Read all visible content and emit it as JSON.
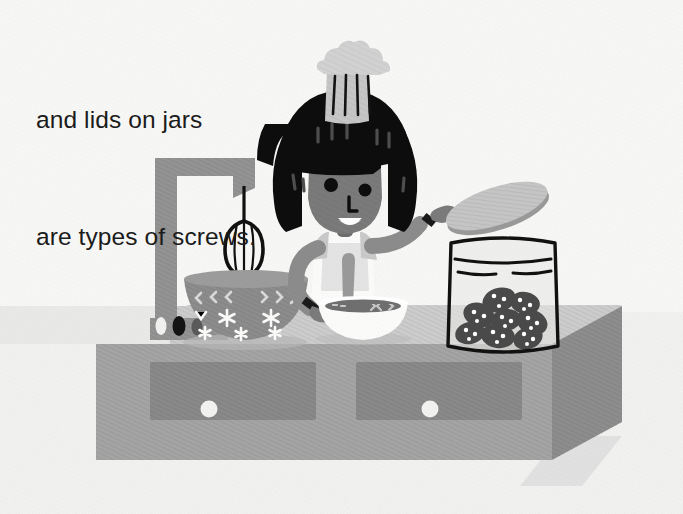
{
  "page": {
    "width": 683,
    "height": 514,
    "background_color": "#f7f7f5",
    "kind": "childrens-book-illustration-page"
  },
  "caption": {
    "line1": "and lids on jars",
    "line2": "are types of screws.",
    "full_text": "and lids on jars are types of screws.",
    "color": "#1b1b1b",
    "font_size_px": 24.5,
    "align": "left"
  },
  "palette": {
    "paper": "#f7f7f5",
    "paper_shade": "#efefec",
    "counter_top": "#cfcfcf",
    "counter_front": "#a5a5a5",
    "counter_side": "#8e8e8e",
    "drawer_panel": "#8a8a8a",
    "knob_white": "#f2f2f0",
    "shadow": "#d8d8d6",
    "skin": "#7b7b7b",
    "hair_black": "#0d0d0d",
    "hair_highlight": "#4a4a4a",
    "hat_light": "#d2d2d2",
    "hat_mid": "#bdbdbd",
    "apron_white": "#fbfbfa",
    "shirt_gray": "#c9c9c9",
    "sleeve_gray": "#8c8c8c",
    "cuff_dark": "#1a1a1a",
    "mixer_gray": "#949494",
    "mixer_bowl": "#8d8d8d",
    "mixer_bowl_rim": "#9c9c9c",
    "bowl_white": "#fbfbfa",
    "bowl_content": "#6f6f6f",
    "jar_outline": "#111111",
    "jar_glass": "#e8e8e6",
    "cookie_dark": "#4a4a4a",
    "cookie_chip": "#ffffff",
    "lid_face": "#c6c6c6",
    "lid_edge": "#9a9a9a"
  },
  "scene": {
    "title": "Chef baking at a kitchen counter",
    "elements": [
      {
        "name": "kitchen-counter",
        "description": "Gray isometric counter unit with two drawers"
      },
      {
        "name": "drawer-left",
        "knob": "round white knob"
      },
      {
        "name": "drawer-right",
        "knob": "round white knob"
      },
      {
        "name": "stand-mixer",
        "description": "Gray stand mixer with hanging beater and patterned bowl"
      },
      {
        "name": "mixer-beater",
        "description": "Black wire whisk attachment"
      },
      {
        "name": "mixer-bowl",
        "description": "Gray bowl decorated with chevrons and asterisk stars"
      },
      {
        "name": "mixer-knob-white",
        "color": "#f2f2f0"
      },
      {
        "name": "mixer-knob-black",
        "color": "#131313"
      },
      {
        "name": "mixer-knob-gray",
        "color": "#5a5a5a"
      },
      {
        "name": "chef-character",
        "description": "Smiling chef with black bob hair and tall toque"
      },
      {
        "name": "chef-hat",
        "stripes": 4
      },
      {
        "name": "mixing-bowl",
        "description": "White bowl with dark batter and a spoon"
      },
      {
        "name": "cookie-jar",
        "description": "Outlined glass jar filled with chocolate chip cookies"
      },
      {
        "name": "jar-lid",
        "description": "Oval gray lid held above the jar"
      }
    ],
    "counter": {
      "drawer_count": 2,
      "knob_count": 2
    },
    "mixer": {
      "knob_count": 3,
      "bowl_star_count": 6,
      "bowl_chevron_count": 6
    },
    "jar": {
      "cookie_count": 8,
      "lid_held": true
    },
    "chef": {
      "hat_stripe_count": 4,
      "hair_highlight_count": 7,
      "expression": "smiling"
    }
  }
}
